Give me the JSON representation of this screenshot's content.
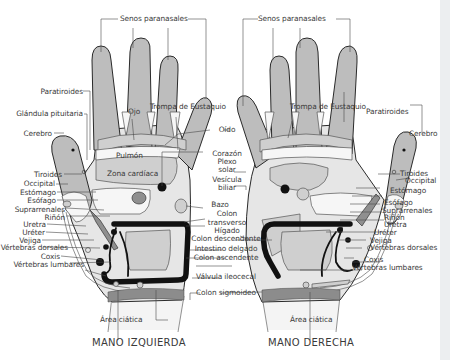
{
  "figure": {
    "colors": {
      "finger_fill": "#bdbdbd",
      "palm_fill": "#e6e6e6",
      "zone_fill": "#cfcfcf",
      "dark_zone": "#8f8f8f",
      "wrist_band": "#8c8c8c",
      "colon_line": "#111111",
      "outline": "#2a2a2a",
      "leader_line": "#4a4a4a",
      "label_text": "#3a3a3a"
    }
  },
  "left_hand": {
    "caption": "MANO IZQUIERDA",
    "labels": {
      "senos": "Senos paranasales",
      "paratiroides": "Paratiroides",
      "glandula": "Glándula pituitaria",
      "ojo": "Ojo",
      "trompa": "Trompa de Eustaquio",
      "cerebro": "Cerebro",
      "pulmon": "Pulmón",
      "zona_cardiaca": "Zona cardíaca",
      "tiroides": "Tiroides",
      "occipital": "Occipital",
      "estomago": "Estómago",
      "esofago": "Esófago",
      "suprarrenales": "Suprarrenales",
      "rinon": "Riñón",
      "uretra": "Uretra",
      "ureter": "Uréter",
      "vejiga": "Vejiga",
      "vertebras_dorsales": "Vértebras dorsales",
      "coxis": "Coxis",
      "vertebras_lumbares": "Vértebras lumbares",
      "area_ciatica": "Área ciática"
    }
  },
  "center_labels": {
    "oido": "Oído",
    "corazon": "Corazón",
    "plexo": "Plexo",
    "solar": "solar",
    "vesicula": "Vesícula",
    "biliar": "biliar",
    "bazo": "Bazo",
    "colon": "Colon",
    "transverso": "transverso",
    "higado": "Hígado",
    "colon_descendente": "Colon descendente",
    "intestino_delgado": "Intestino delgado",
    "colon_ascendente": "Colon ascendente",
    "valvula_ileocecal": "Válvula ileocecal",
    "colon_sigmoideo": "Colon sigmoideo"
  },
  "right_hand": {
    "caption": "MANO DERECHA",
    "labels": {
      "senos": "Senos paranasales",
      "trompa": "Trompa de Eustaquio",
      "paratiroides": "Paratiroides",
      "cerebro": "Cerebro",
      "tiroides": "Tiroides",
      "occipital": "Occipital",
      "estomago": "Estómago",
      "esofago": "Esófago",
      "suprarrenales": "Suprarrenales",
      "rinon": "Riñón",
      "uretra": "Uretra",
      "ureter": "Uréter",
      "vejiga": "Vejiga",
      "vertebras_dorsales": "Vértebras dorsales",
      "coxis": "Coxis",
      "vertebras_lumbares": "Vértebras lumbares",
      "area_ciatica": "Área ciática"
    }
  }
}
